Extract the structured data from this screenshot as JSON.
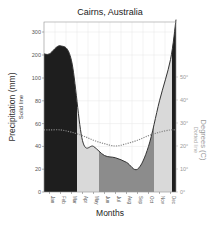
{
  "chart_data": {
    "type": "area",
    "title": "Cairns, Australia",
    "xlabel": "Months",
    "ylabel": "Precipitation (mm)",
    "ylabel_sub": "Solid line",
    "y2label": "Degrees (C)",
    "y2label_sub": "Dotted line",
    "categories": [
      "Jan",
      "Feb",
      "Mar",
      "Apr",
      "May",
      "Jun",
      "Jul",
      "Aug",
      "Sep",
      "Oct",
      "Nov",
      "Dec"
    ],
    "left_ticks": [
      0,
      20,
      40,
      60,
      80,
      100,
      200,
      300
    ],
    "right_ticks": [
      "0°",
      "10°",
      "20°",
      "30°",
      "40°",
      "50°"
    ],
    "grid": true,
    "series": [
      {
        "name": "Precipitation (mm)",
        "style": "solid",
        "values": [
          205,
          240,
          175,
          45,
          40,
          32,
          30,
          26,
          20,
          40,
          80,
          180
        ]
      },
      {
        "name": "Temperature (°C)",
        "style": "dotted",
        "values": [
          27,
          27,
          26,
          24.5,
          22.5,
          21,
          20,
          21,
          22.5,
          24.5,
          26,
          27
        ]
      }
    ],
    "regions": [
      {
        "from": "Jan",
        "to": "Mar",
        "fill": "#1e1e1e",
        "meaning": "very wet"
      },
      {
        "from": "Apr",
        "to": "May",
        "fill": "#d9d9d9",
        "meaning": "humid"
      },
      {
        "from": "Jun",
        "to": "Oct",
        "fill": "#8c8c8c",
        "meaning": "arid"
      },
      {
        "from": "Nov",
        "to": "Dec",
        "fill": "#d9d9d9",
        "meaning": "humid"
      },
      {
        "from": "Dec",
        "to": "Dec",
        "fill": "#1e1e1e",
        "meaning": "very wet"
      }
    ],
    "colors": {
      "very_wet": "#1e1e1e",
      "humid": "#d9d9d9",
      "arid": "#8c8c8c",
      "line": "#333333",
      "temp_line": "#888888",
      "grid": "#e6e6e6"
    }
  }
}
